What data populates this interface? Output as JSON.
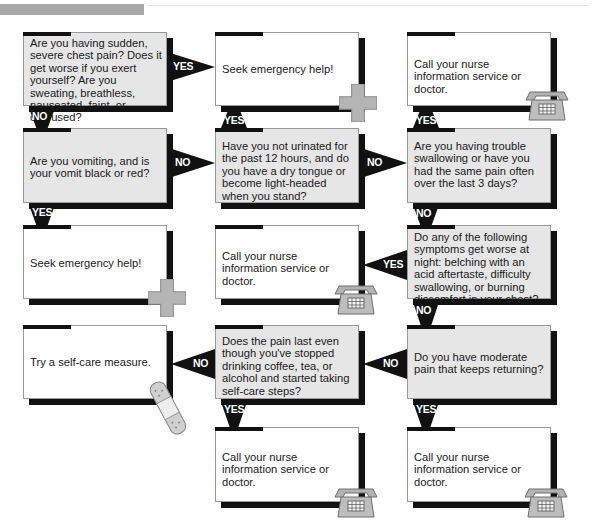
{
  "header": {
    "bar_color": "#a9a9a9"
  },
  "colors": {
    "question_fill": "#e6e6e6",
    "answer_fill": "#ffffff",
    "shadow": "#111111",
    "icon_gray": "#b3b3b3"
  },
  "nodes": [
    {
      "id": "q1",
      "type": "question",
      "text": "Are you having sudden, severe chest pain? Does it get worse if you exert yourself? Are you sweating, breathless, nauseated, faint, or confused?"
    },
    {
      "id": "a1",
      "type": "answer",
      "text": "Seek emergency help!",
      "icon": "medical-cross-icon"
    },
    {
      "id": "a2",
      "type": "answer",
      "text": "Call your nurse information service or doctor.",
      "icon": "telephone-icon"
    },
    {
      "id": "q2",
      "type": "question",
      "text": "Are you vomiting, and is your vomit black or red?"
    },
    {
      "id": "q3",
      "type": "question",
      "text": "Have you not urinated for the past 12 hours, and do you have a dry tongue or become light-headed when you stand?"
    },
    {
      "id": "q4",
      "type": "question",
      "text": "Are you having trouble swallowing or have you had the same pain often over the last 3 days?"
    },
    {
      "id": "a3",
      "type": "answer",
      "text": "Seek emergency help!",
      "icon": "medical-cross-icon"
    },
    {
      "id": "a4",
      "type": "answer",
      "text": "Call your nurse information service or doctor.",
      "icon": "telephone-icon"
    },
    {
      "id": "q5",
      "type": "question",
      "text": "Do any of the following symptoms get worse at night: belching with an acid aftertaste, difficulty swallowing, or burning discomfort in your chest?"
    },
    {
      "id": "a5",
      "type": "answer",
      "text": "Try a self-care measure.",
      "icon": "bandage-icon"
    },
    {
      "id": "q6",
      "type": "question",
      "text": "Does the pain last even though you've stopped drinking coffee, tea, or alcohol and started taking self-care steps?"
    },
    {
      "id": "q7",
      "type": "question",
      "text": "Do you have moderate pain that keeps returning?"
    },
    {
      "id": "a6",
      "type": "answer",
      "text": "Call your nurse information service or doctor.",
      "icon": "telephone-icon"
    },
    {
      "id": "a7",
      "type": "answer",
      "text": "Call your nurse information service or doctor.",
      "icon": "telephone-icon"
    }
  ],
  "edges": [
    {
      "from": "q1",
      "to": "a1",
      "label": "YES"
    },
    {
      "from": "q1",
      "to": "q2",
      "label": "NO"
    },
    {
      "from": "q2",
      "to": "q3",
      "label": "NO"
    },
    {
      "from": "q3",
      "to": "a1",
      "label": "YES"
    },
    {
      "from": "q3",
      "to": "q4",
      "label": "NO"
    },
    {
      "from": "q4",
      "to": "a2",
      "label": "YES"
    },
    {
      "from": "q2",
      "to": "a3",
      "label": "YES"
    },
    {
      "from": "q4",
      "to": "q5",
      "label": "NO"
    },
    {
      "from": "q5",
      "to": "a4",
      "label": "YES"
    },
    {
      "from": "q5",
      "to": "q7",
      "label": "NO"
    },
    {
      "from": "q7",
      "to": "q6",
      "label": "NO"
    },
    {
      "from": "q6",
      "to": "a5",
      "label": "NO"
    },
    {
      "from": "q6",
      "to": "a6",
      "label": "YES"
    },
    {
      "from": "q7",
      "to": "a7",
      "label": "YES"
    }
  ]
}
